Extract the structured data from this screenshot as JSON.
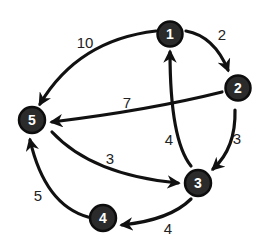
{
  "graph": {
    "type": "directed-weighted-graph",
    "nodes": [
      {
        "id": "1",
        "label": "1",
        "x": 170,
        "y": 34
      },
      {
        "id": "2",
        "label": "2",
        "x": 238,
        "y": 88
      },
      {
        "id": "3",
        "label": "3",
        "x": 198,
        "y": 183
      },
      {
        "id": "4",
        "label": "4",
        "x": 102,
        "y": 218
      },
      {
        "id": "5",
        "label": "5",
        "x": 32,
        "y": 120
      }
    ],
    "edges": [
      {
        "from": "1",
        "to": "2",
        "weight": "2"
      },
      {
        "from": "1",
        "to": "5",
        "weight": "10"
      },
      {
        "from": "2",
        "to": "5",
        "weight": "7"
      },
      {
        "from": "2",
        "to": "3",
        "weight": "3"
      },
      {
        "from": "3",
        "to": "1",
        "weight": "4"
      },
      {
        "from": "5",
        "to": "3",
        "weight": "3"
      },
      {
        "from": "3",
        "to": "4",
        "weight": "4"
      },
      {
        "from": "4",
        "to": "5",
        "weight": "5"
      }
    ]
  },
  "colors": {
    "node_fill": "#2b2b2b",
    "node_text": "#ffffff",
    "edge": "#111111",
    "label": "#222222",
    "background": "#ffffff"
  }
}
